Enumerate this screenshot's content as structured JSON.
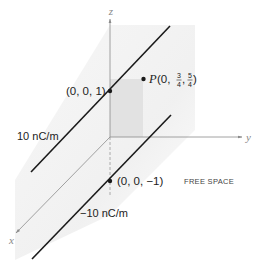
{
  "diagram": {
    "axes": {
      "x_label": "x",
      "y_label": "y",
      "z_label": "z"
    },
    "line_charges": [
      {
        "label": "10 nC/m",
        "point_label": "(0, 0, 1)"
      },
      {
        "label": "−10 nC/m",
        "point_label": "(0, 0, −1)"
      }
    ],
    "point_P": {
      "name": "P",
      "prefix": "(0, ",
      "y_num": "3",
      "y_den": "4",
      "sep": ", ",
      "z_num": "5",
      "z_den": "4",
      "suffix": ")"
    },
    "region_label": "FREE SPACE",
    "colors": {
      "line": "#1a1a1a",
      "axis": "#8a8a8a",
      "shade": "#e4e4e4",
      "background_shade": "#f3f3f3"
    }
  }
}
